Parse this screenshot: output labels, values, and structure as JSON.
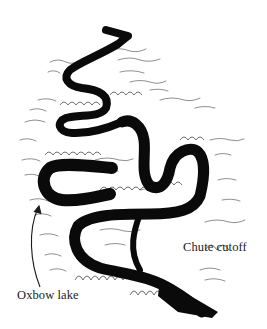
{
  "diagram": {
    "labels": {
      "oxbow_lake": "Oxbow lake",
      "chute_cutoff": "Chute cutoff"
    },
    "colors": {
      "background": "#ffffff",
      "river": "#0a0a0a",
      "ink": "#1a1a1a",
      "vegetation": "#333333"
    },
    "icons": {
      "arrow": "curved-arrow-icon"
    }
  }
}
